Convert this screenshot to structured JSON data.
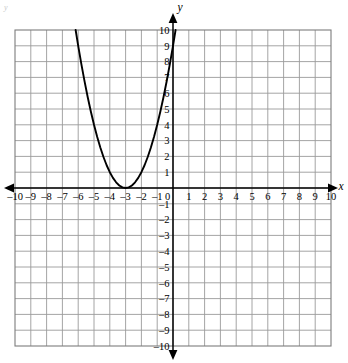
{
  "chart_data": {
    "type": "line",
    "title": "",
    "xlabel": "x",
    "ylabel": "y",
    "xlim": [
      -10,
      10
    ],
    "ylim": [
      -10,
      10
    ],
    "grid": true,
    "grid_step": 1,
    "legend": "none",
    "equation": "y = (x + 3)^2",
    "vertex": [
      -3,
      0
    ],
    "x_ticks": [
      -10,
      -9,
      -8,
      -7,
      -6,
      -5,
      -4,
      -3,
      -2,
      -1,
      0,
      1,
      2,
      3,
      4,
      5,
      6,
      7,
      8,
      9,
      10
    ],
    "x_tick_labels": [
      "–10",
      "–9",
      "–8",
      "–7",
      "–6",
      "–5",
      "–4",
      "–3",
      "–2",
      "–1",
      "0",
      "1",
      "2",
      "3",
      "4",
      "5",
      "6",
      "7",
      "8",
      "9",
      "10"
    ],
    "y_ticks": [
      10,
      9,
      8,
      7,
      6,
      5,
      4,
      3,
      2,
      1,
      -1,
      -2,
      -3,
      -4,
      -5,
      -6,
      -7,
      -8,
      -9,
      -10
    ],
    "y_tick_labels": [
      "10",
      "9",
      "8",
      "7",
      "6",
      "5",
      "4",
      "3",
      "2",
      "1",
      "–1",
      "–2",
      "–3",
      "–4",
      "–5",
      "–6",
      "–7",
      "–8",
      "–9",
      "–10"
    ],
    "series": [
      {
        "name": "parabola",
        "color": "#000000",
        "points": [
          [
            -6.162,
            10.0
          ],
          [
            -6.0,
            9.0
          ],
          [
            -5.8,
            7.84
          ],
          [
            -5.6,
            6.76
          ],
          [
            -5.4,
            5.76
          ],
          [
            -5.2,
            4.84
          ],
          [
            -5.0,
            4.0
          ],
          [
            -4.8,
            3.24
          ],
          [
            -4.6,
            2.56
          ],
          [
            -4.4,
            1.96
          ],
          [
            -4.2,
            1.44
          ],
          [
            -4.0,
            1.0
          ],
          [
            -3.8,
            0.64
          ],
          [
            -3.6,
            0.36
          ],
          [
            -3.4,
            0.16
          ],
          [
            -3.2,
            0.04
          ],
          [
            -3.0,
            0.0
          ],
          [
            -2.8,
            0.04
          ],
          [
            -2.6,
            0.16
          ],
          [
            -2.4,
            0.36
          ],
          [
            -2.2,
            0.64
          ],
          [
            -2.0,
            1.0
          ],
          [
            -1.8,
            1.44
          ],
          [
            -1.6,
            1.96
          ],
          [
            -1.4,
            2.56
          ],
          [
            -1.2,
            3.24
          ],
          [
            -1.0,
            4.0
          ],
          [
            -0.8,
            4.84
          ],
          [
            -0.6,
            5.76
          ],
          [
            -0.4,
            6.76
          ],
          [
            -0.2,
            7.84
          ],
          [
            0.0,
            9.0
          ],
          [
            0.1623,
            10.0
          ]
        ]
      }
    ]
  },
  "axes": {
    "x_axis_label": "x",
    "y_axis_label": "y",
    "origin_label": "0"
  },
  "artifact": {
    "corner_mark": "y"
  }
}
